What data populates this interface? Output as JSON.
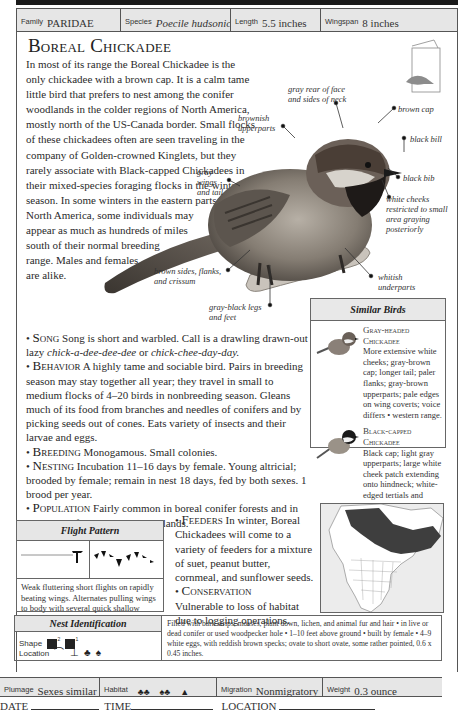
{
  "header": {
    "family_label": "Family",
    "family_value": "PARIDAE",
    "species_label": "Species",
    "species_value": "Poecile hudsonica",
    "length_label": "Length",
    "length_value": "5.5 inches",
    "wingspan_label": "Wingspan",
    "wingspan_value": "8 inches"
  },
  "title": "Boreal Chickadee",
  "intro": "In most of its range the Boreal Chickadee is the only chickadee with a brown cap. It is a calm tame little bird that prefers to nest among the conifer woodlands in the colder regions of North America, mostly north of the US-Canada border. Small flocks of these chickadees often are seen traveling in the company of Golden-crowned Kinglets, but they rarely associate with Black-capped Chickadees in their mixed-species foraging flocks in the winter season. In some winters in the eastern parts of North America, some individuals may appear as much as hundreds of miles south of their normal breeding range. Males and females are alike.",
  "callouts": {
    "gray_rear": "gray rear of face and sides of neck",
    "brown_cap": "brown cap",
    "brownish_upperparts": "brownish upperparts",
    "black_bill": "black bill",
    "gray_wings": "gray wings and tail",
    "black_bib": "black bib",
    "white_cheeks": "white cheeks restricted to small area graying posteriorly",
    "brown_sides": "brown sides, flanks, and crissum",
    "whitish_underparts": "whitish underparts",
    "legs": "gray-black legs and feet"
  },
  "sections": {
    "song_head": "Song",
    "song_text": "Song is short and warbled. Call is a drawling drawn-out lazy",
    "song_call1": "chick-a-dee-dee-dee",
    "song_or": "or",
    "song_call2": "chick-chee-day-day.",
    "behavior_head": "Behavior",
    "behavior_text": "A highly tame and sociable bird. Pairs in breeding season may stay together all year; they travel in small to medium flocks of 4–20 birds in nonbreeding season. Gleans much of its food from branches and needles of conifers and by picking seeds out of cones. Eats variety of insects and their larvae and eggs.",
    "breeding_head": "Breeding",
    "breeding_text": "Monogamous. Small colonies.",
    "nesting_head": "Nesting",
    "nesting_text": "Incubation 11–16 days by female. Young altricial; brooded by female; remain in nest 18 days, fed by both sexes. 1 brood per year.",
    "population_head": "Population",
    "population_text": "Fairly common in boreal conifer forests and in mixed conifer-deciduous woodlands.",
    "feeders_head": "Feeders",
    "feeders_text": "In winter, Boreal Chickadees will come to a variety of feeders for a mixture of suet, peanut butter, cornmeal, and sunflower seeds.",
    "conservation_head": "Conservation",
    "conservation_text": "Vulnerable to loss of habitat due to logging operations."
  },
  "similar_birds": {
    "title": "Similar Birds",
    "items": [
      {
        "name": "Gray-headed Chickadee",
        "text": "More extensive white cheeks; gray-brown cap; longer tail; paler flanks; gray-brown upperparts; pale edges on wing coverts; voice differs • western range."
      },
      {
        "name": "Black-capped Chickadee",
        "text": "Black cap; light gray upperparts; large white cheek patch extending onto hindneck; white-edged tertials and secondaries; different livelier call."
      }
    ]
  },
  "flight": {
    "title": "Flight Pattern",
    "description": "Weak fluttering short flights on rapidly beating wings. Alternates pulling wings to body with several quick shallow strokes."
  },
  "nest": {
    "title": "Nest Identification",
    "shape_label": "Shape",
    "shape_sup1": "2",
    "shape_sup2": "1",
    "location_label": "Location",
    "description": "Filled with bark strips, mosses, plant down, lichen, and animal fur and hair • in live or dead conifer or used woodpecker hole • 1–10 feet above ground • built by female • 4–9 white eggs, with reddish brown specks; ovate to short ovate, some rather pointed, 0.6 x 0.45 inches."
  },
  "footer": {
    "plumage_label": "Plumage",
    "plumage_value": "Sexes similar",
    "habitat_label": "Habitat",
    "migration_label": "Migration",
    "migration_value": "Nonmigratory",
    "weight_label": "Weight",
    "weight_value": "0.3 ounce"
  },
  "log": {
    "date_label": "DATE",
    "time_label": "TIME",
    "location_label": "LOCATION"
  },
  "colors": {
    "header_bg": "#e6e6e6",
    "border": "#555555",
    "text": "#222222"
  }
}
